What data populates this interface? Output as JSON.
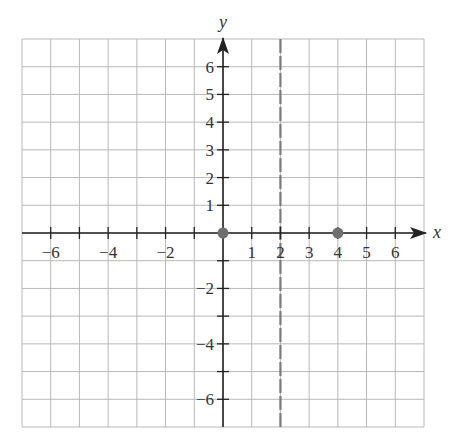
{
  "chart_data": {
    "type": "scatter",
    "title": "",
    "xlabel": "x",
    "ylabel": "y",
    "xlim": [
      -7,
      7
    ],
    "ylim": [
      -7,
      7
    ],
    "grid": true,
    "x_ticks": [
      -6,
      -4,
      -2,
      1,
      2,
      3,
      4,
      5,
      6
    ],
    "x_tick_labels": [
      "−6",
      "−4",
      "−2",
      "1",
      "2",
      "3",
      "4",
      "5",
      "6"
    ],
    "y_ticks": [
      6,
      5,
      4,
      3,
      2,
      1,
      -2,
      -4,
      -6
    ],
    "y_tick_labels": [
      "6",
      "5",
      "4",
      "3",
      "2",
      "1",
      "−2",
      "−4",
      "−6"
    ],
    "points": [
      {
        "x": 0,
        "y": 0
      },
      {
        "x": 4,
        "y": 0
      }
    ],
    "vertical_asymptote": {
      "x": 2,
      "style": "dashed"
    },
    "colors": {
      "grid": "#b8b8b8",
      "axis": "#222222",
      "point": "#6f6f6f",
      "dashed_line": "#7a7a7a"
    }
  }
}
